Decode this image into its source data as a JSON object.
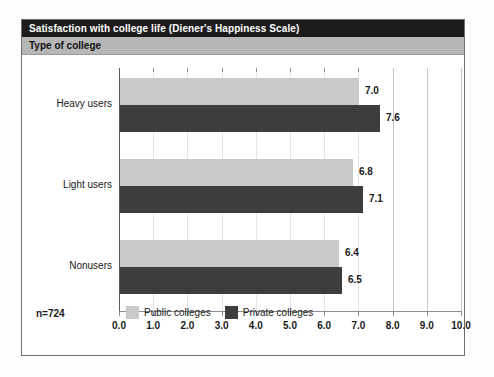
{
  "header": {
    "title": "Satisfaction with college life (Diener's Happiness Scale)",
    "subtitle": "Type of college"
  },
  "footer": {
    "sample_size": "n=724"
  },
  "colors": {
    "title_bar": "#1c1c1c",
    "subtitle_bar": "#b6b6b6",
    "public": "#c9c9c9",
    "private": "#3d3d3d",
    "frame_border": "#6e6e78",
    "gridline": "#c6c6cc"
  },
  "chart_data": {
    "type": "bar",
    "orientation": "horizontal",
    "title": "Satisfaction with college life (Diener's Happiness Scale)",
    "subtitle": "Type of college",
    "categories": [
      "Heavy users",
      "Light users",
      "Nonusers"
    ],
    "series": [
      {
        "name": "Public colleges",
        "color": "#c9c9c9",
        "values": [
          7.0,
          6.8,
          6.4
        ]
      },
      {
        "name": "Private colleges",
        "color": "#3d3d3d",
        "values": [
          7.6,
          7.1,
          6.5
        ]
      }
    ],
    "value_labels": [
      [
        "7.0",
        "7.6"
      ],
      [
        "6.8",
        "7.1"
      ],
      [
        "6.4",
        "6.5"
      ]
    ],
    "xlabel": "",
    "ylabel": "",
    "xlim": [
      0.0,
      10.0
    ],
    "xticks": [
      0.0,
      1.0,
      2.0,
      3.0,
      4.0,
      5.0,
      6.0,
      7.0,
      8.0,
      9.0,
      10.0
    ],
    "xtick_labels": [
      "0.0",
      "1.0",
      "2.0",
      "3.0",
      "4.0",
      "5.0",
      "6.0",
      "7.0",
      "8.0",
      "9.0",
      "10.0"
    ],
    "grid": true,
    "legend_position": "bottom",
    "annotation": "n=724"
  }
}
